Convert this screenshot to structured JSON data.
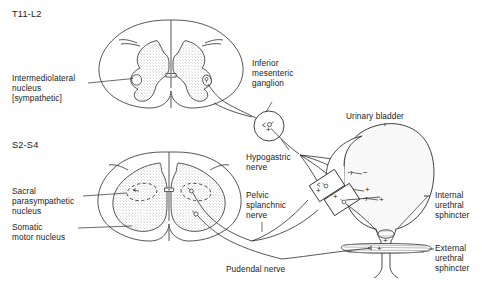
{
  "figure": {
    "background": "#ffffff",
    "line_color": "#2b2b2b",
    "gray_matter_fill": "#e0e0e0",
    "bladder_fill": "#ececec"
  },
  "labels": {
    "level_thoracic": "T11-L2",
    "level_sacral": "S2-S4",
    "intermediolateral_nucleus": "Intermediolateral\nnucleus\n[sympathetic]",
    "sacral_parasympathetic_nucleus": "Sacral\nparasympathetic\nnucleus",
    "somatic_motor_nucleus": "Somatic\nmotor nucleus",
    "inferior_mesenteric_ganglion": "Inferior\nmesenteric\nganglion",
    "hypogastric_nerve": "Hypogastric\nnerve",
    "pelvic_splanchnic_nerve": "Pelvic\nsplanchnic\nnerve",
    "pudendal_nerve": "Pudendal nerve",
    "urinary_bladder": "Urinary bladder",
    "internal_urethral_sphincter": "Internal\nurethral\nsphincter",
    "external_urethral_sphincter": "External\nurethral\nsphincter"
  },
  "synapse_signs": {
    "ganglion_plus": "+",
    "bladder_wall_minus": "−",
    "bladder_wall_plus_1": "+",
    "bladder_wall_plus_2": "+",
    "bladder_wall_plus_3": "+",
    "bladder_wall_plus_4": "+",
    "pelvic_ganglion_plus_1": "+",
    "pelvic_ganglion_plus_2": "+",
    "internal_sphincter_plus": "+",
    "external_sphincter_plus": "+"
  }
}
